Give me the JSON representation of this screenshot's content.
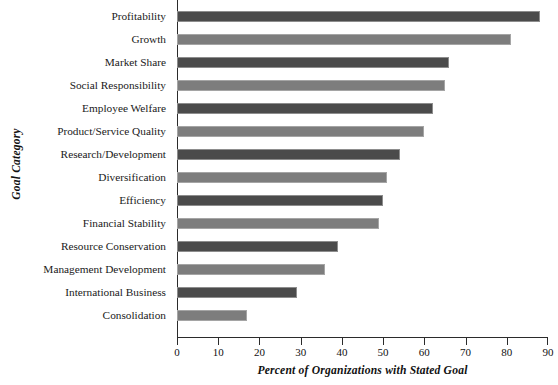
{
  "chart_data": {
    "type": "bar",
    "orientation": "horizontal",
    "title": "",
    "xlabel": "Percent of Organizations with Stated Goal",
    "ylabel": "Goal Category",
    "xlim": [
      0,
      90
    ],
    "xticks": [
      0,
      10,
      20,
      30,
      40,
      50,
      60,
      70,
      80,
      90
    ],
    "xtick_labels": [
      "0",
      "10",
      "20",
      "30",
      "40",
      "50",
      "60",
      "70",
      "80",
      "90"
    ],
    "grid": false,
    "legend": null,
    "categories": [
      "Profitability",
      "Growth",
      "Market Share",
      "Social Responsibility",
      "Employee Welfare",
      "Product/Service Quality",
      "Research/Development",
      "Diversification",
      "Efficiency",
      "Financial Stability",
      "Resource Conservation",
      "Management Development",
      "International Business",
      "Consolidation"
    ],
    "values": [
      88,
      81,
      66,
      65,
      62,
      60,
      54,
      51,
      50,
      49,
      39,
      36,
      29,
      17
    ],
    "bar_colors": [
      "#4b4b4b",
      "#7d7d7d",
      "#4b4b4b",
      "#7d7d7d",
      "#4b4b4b",
      "#7d7d7d",
      "#4b4b4b",
      "#7d7d7d",
      "#4b4b4b",
      "#7d7d7d",
      "#4b4b4b",
      "#7d7d7d",
      "#4b4b4b",
      "#7d7d7d"
    ],
    "colors": {
      "dark_bar": "#4b4b4b",
      "light_bar": "#7d7d7d",
      "axis": "#2b2b2b",
      "background": "#ffffff",
      "text": "#111111"
    }
  }
}
